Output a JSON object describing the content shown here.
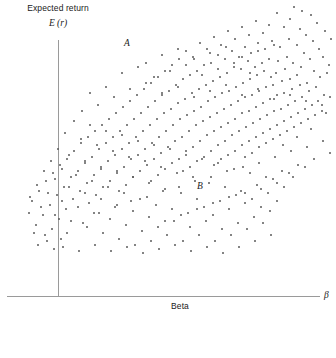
{
  "chart_data": {
    "type": "scatter",
    "title": "",
    "ylabel": "Expected return",
    "ylabel_symbol": "E (r)",
    "xlabel": "Beta",
    "xlabel_symbol": "β",
    "grid": false,
    "legend": null,
    "xlim": [
      -0.5,
      3.0
    ],
    "ylim": [
      0,
      1.0
    ],
    "annotations": [
      {
        "text": "A",
        "x_px": 124,
        "y_px": 38
      },
      {
        "text": "B",
        "x_px": 197,
        "y_px": 181
      }
    ],
    "axis_color": "#9a9a9a",
    "point_color": "#5b5b5b",
    "n_points": 420,
    "points": [
      [
        293,
        6
      ],
      [
        301,
        10
      ],
      [
        289,
        18
      ],
      [
        310,
        14
      ],
      [
        283,
        26
      ],
      [
        299,
        28
      ],
      [
        316,
        22
      ],
      [
        305,
        34
      ],
      [
        276,
        12
      ],
      [
        268,
        24
      ],
      [
        324,
        30
      ],
      [
        288,
        38
      ],
      [
        296,
        44
      ],
      [
        312,
        40
      ],
      [
        262,
        32
      ],
      [
        279,
        46
      ],
      [
        318,
        48
      ],
      [
        303,
        52
      ],
      [
        255,
        20
      ],
      [
        271,
        40
      ],
      [
        330,
        38
      ],
      [
        286,
        56
      ],
      [
        309,
        58
      ],
      [
        248,
        34
      ],
      [
        264,
        48
      ],
      [
        322,
        56
      ],
      [
        292,
        62
      ],
      [
        241,
        26
      ],
      [
        257,
        42
      ],
      [
        277,
        60
      ],
      [
        300,
        66
      ],
      [
        328,
        64
      ],
      [
        234,
        38
      ],
      [
        250,
        52
      ],
      [
        268,
        58
      ],
      [
        284,
        68
      ],
      [
        313,
        70
      ],
      [
        227,
        30
      ],
      [
        244,
        46
      ],
      [
        261,
        62
      ],
      [
        275,
        72
      ],
      [
        296,
        74
      ],
      [
        319,
        76
      ],
      [
        220,
        44
      ],
      [
        238,
        56
      ],
      [
        254,
        66
      ],
      [
        270,
        76
      ],
      [
        289,
        78
      ],
      [
        306,
        82
      ],
      [
        326,
        72
      ],
      [
        213,
        36
      ],
      [
        231,
        50
      ],
      [
        247,
        60
      ],
      [
        263,
        70
      ],
      [
        281,
        80
      ],
      [
        299,
        84
      ],
      [
        315,
        86
      ],
      [
        206,
        48
      ],
      [
        224,
        58
      ],
      [
        240,
        68
      ],
      [
        256,
        74
      ],
      [
        272,
        84
      ],
      [
        291,
        88
      ],
      [
        308,
        90
      ],
      [
        323,
        94
      ],
      [
        199,
        42
      ],
      [
        217,
        54
      ],
      [
        233,
        66
      ],
      [
        249,
        78
      ],
      [
        265,
        86
      ],
      [
        283,
        92
      ],
      [
        301,
        96
      ],
      [
        317,
        100
      ],
      [
        192,
        56
      ],
      [
        210,
        62
      ],
      [
        226,
        72
      ],
      [
        242,
        82
      ],
      [
        258,
        90
      ],
      [
        276,
        94
      ],
      [
        294,
        100
      ],
      [
        311,
        104
      ],
      [
        329,
        96
      ],
      [
        185,
        50
      ],
      [
        203,
        64
      ],
      [
        219,
        76
      ],
      [
        235,
        86
      ],
      [
        251,
        94
      ],
      [
        269,
        98
      ],
      [
        287,
        104
      ],
      [
        304,
        108
      ],
      [
        321,
        110
      ],
      [
        178,
        58
      ],
      [
        196,
        70
      ],
      [
        212,
        80
      ],
      [
        228,
        90
      ],
      [
        244,
        96
      ],
      [
        262,
        102
      ],
      [
        280,
        108
      ],
      [
        297,
        112
      ],
      [
        314,
        114
      ],
      [
        171,
        64
      ],
      [
        189,
        74
      ],
      [
        205,
        84
      ],
      [
        221,
        92
      ],
      [
        237,
        100
      ],
      [
        255,
        106
      ],
      [
        273,
        110
      ],
      [
        290,
        116
      ],
      [
        307,
        118
      ],
      [
        325,
        112
      ],
      [
        164,
        70
      ],
      [
        182,
        78
      ],
      [
        198,
        88
      ],
      [
        214,
        96
      ],
      [
        230,
        104
      ],
      [
        248,
        110
      ],
      [
        266,
        114
      ],
      [
        283,
        120
      ],
      [
        300,
        122
      ],
      [
        157,
        76
      ],
      [
        175,
        84
      ],
      [
        191,
        92
      ],
      [
        207,
        100
      ],
      [
        223,
        108
      ],
      [
        241,
        112
      ],
      [
        259,
        118
      ],
      [
        276,
        124
      ],
      [
        293,
        126
      ],
      [
        310,
        128
      ],
      [
        150,
        82
      ],
      [
        168,
        90
      ],
      [
        184,
        98
      ],
      [
        200,
        106
      ],
      [
        216,
        112
      ],
      [
        234,
        118
      ],
      [
        252,
        122
      ],
      [
        269,
        128
      ],
      [
        286,
        130
      ],
      [
        143,
        88
      ],
      [
        161,
        94
      ],
      [
        177,
        102
      ],
      [
        193,
        110
      ],
      [
        209,
        116
      ],
      [
        227,
        122
      ],
      [
        245,
        126
      ],
      [
        262,
        132
      ],
      [
        279,
        134
      ],
      [
        296,
        136
      ],
      [
        136,
        94
      ],
      [
        154,
        100
      ],
      [
        170,
        108
      ],
      [
        186,
        114
      ],
      [
        202,
        120
      ],
      [
        220,
        126
      ],
      [
        238,
        130
      ],
      [
        255,
        136
      ],
      [
        272,
        138
      ],
      [
        129,
        100
      ],
      [
        147,
        106
      ],
      [
        163,
        112
      ],
      [
        179,
        118
      ],
      [
        195,
        124
      ],
      [
        213,
        130
      ],
      [
        231,
        134
      ],
      [
        248,
        140
      ],
      [
        265,
        142
      ],
      [
        282,
        144
      ],
      [
        122,
        106
      ],
      [
        140,
        112
      ],
      [
        156,
        118
      ],
      [
        172,
        124
      ],
      [
        188,
        130
      ],
      [
        206,
        134
      ],
      [
        224,
        140
      ],
      [
        241,
        144
      ],
      [
        258,
        146
      ],
      [
        115,
        112
      ],
      [
        133,
        118
      ],
      [
        149,
        124
      ],
      [
        165,
        130
      ],
      [
        181,
        136
      ],
      [
        199,
        140
      ],
      [
        217,
        144
      ],
      [
        234,
        150
      ],
      [
        251,
        152
      ],
      [
        108,
        118
      ],
      [
        126,
        124
      ],
      [
        142,
        130
      ],
      [
        158,
        136
      ],
      [
        174,
        140
      ],
      [
        192,
        146
      ],
      [
        210,
        150
      ],
      [
        227,
        154
      ],
      [
        244,
        156
      ],
      [
        101,
        124
      ],
      [
        119,
        130
      ],
      [
        135,
        136
      ],
      [
        151,
        142
      ],
      [
        167,
        146
      ],
      [
        185,
        150
      ],
      [
        203,
        156
      ],
      [
        220,
        158
      ],
      [
        94,
        130
      ],
      [
        112,
        136
      ],
      [
        128,
        142
      ],
      [
        144,
        148
      ],
      [
        160,
        152
      ],
      [
        178,
        158
      ],
      [
        196,
        160
      ],
      [
        213,
        164
      ],
      [
        87,
        136
      ],
      [
        105,
        142
      ],
      [
        121,
        148
      ],
      [
        137,
        154
      ],
      [
        153,
        158
      ],
      [
        171,
        162
      ],
      [
        189,
        166
      ],
      [
        80,
        142
      ],
      [
        98,
        148
      ],
      [
        114,
        154
      ],
      [
        130,
        158
      ],
      [
        146,
        164
      ],
      [
        164,
        168
      ],
      [
        182,
        170
      ],
      [
        73,
        150
      ],
      [
        91,
        156
      ],
      [
        107,
        160
      ],
      [
        123,
        166
      ],
      [
        139,
        170
      ],
      [
        157,
        174
      ],
      [
        66,
        158
      ],
      [
        84,
        162
      ],
      [
        100,
        168
      ],
      [
        116,
        172
      ],
      [
        132,
        176
      ],
      [
        150,
        180
      ],
      [
        59,
        164
      ],
      [
        77,
        170
      ],
      [
        93,
        174
      ],
      [
        109,
        180
      ],
      [
        125,
        184
      ],
      [
        52,
        172
      ],
      [
        70,
        176
      ],
      [
        86,
        182
      ],
      [
        102,
        186
      ],
      [
        118,
        190
      ],
      [
        45,
        180
      ],
      [
        63,
        186
      ],
      [
        79,
        190
      ],
      [
        95,
        194
      ],
      [
        38,
        190
      ],
      [
        56,
        194
      ],
      [
        72,
        198
      ],
      [
        88,
        202
      ],
      [
        31,
        200
      ],
      [
        49,
        204
      ],
      [
        65,
        208
      ],
      [
        42,
        214
      ],
      [
        58,
        218
      ],
      [
        35,
        224
      ],
      [
        51,
        228
      ],
      [
        28,
        212
      ],
      [
        44,
        234
      ],
      [
        60,
        238
      ],
      [
        37,
        244
      ],
      [
        53,
        248
      ],
      [
        66,
        232
      ],
      [
        82,
        222
      ],
      [
        98,
        212
      ],
      [
        114,
        206
      ],
      [
        130,
        200
      ],
      [
        146,
        196
      ],
      [
        162,
        190
      ],
      [
        178,
        186
      ],
      [
        194,
        180
      ],
      [
        210,
        176
      ],
      [
        226,
        170
      ],
      [
        242,
        166
      ],
      [
        258,
        162
      ],
      [
        274,
        156
      ],
      [
        290,
        150
      ],
      [
        306,
        146
      ],
      [
        322,
        140
      ],
      [
        145,
        62
      ],
      [
        161,
        54
      ],
      [
        177,
        48
      ],
      [
        193,
        58
      ],
      [
        209,
        52
      ],
      [
        225,
        46
      ],
      [
        241,
        56
      ],
      [
        257,
        50
      ],
      [
        273,
        44
      ],
      [
        121,
        72
      ],
      [
        137,
        66
      ],
      [
        153,
        76
      ],
      [
        169,
        70
      ],
      [
        185,
        64
      ],
      [
        201,
        74
      ],
      [
        217,
        68
      ],
      [
        233,
        62
      ],
      [
        249,
        72
      ],
      [
        105,
        86
      ],
      [
        89,
        92
      ],
      [
        113,
        96
      ],
      [
        97,
        104
      ],
      [
        81,
        110
      ],
      [
        129,
        88
      ],
      [
        145,
        82
      ],
      [
        161,
        92
      ],
      [
        177,
        86
      ],
      [
        193,
        96
      ],
      [
        209,
        90
      ],
      [
        225,
        84
      ],
      [
        241,
        94
      ],
      [
        257,
        88
      ],
      [
        273,
        98
      ],
      [
        289,
        94
      ],
      [
        305,
        100
      ],
      [
        321,
        104
      ],
      [
        73,
        120
      ],
      [
        89,
        124
      ],
      [
        105,
        130
      ],
      [
        121,
        134
      ],
      [
        137,
        140
      ],
      [
        153,
        144
      ],
      [
        169,
        148
      ],
      [
        185,
        154
      ],
      [
        201,
        158
      ],
      [
        217,
        162
      ],
      [
        233,
        168
      ],
      [
        249,
        172
      ],
      [
        265,
        176
      ],
      [
        281,
        170
      ],
      [
        297,
        164
      ],
      [
        313,
        158
      ],
      [
        329,
        152
      ],
      [
        64,
        132
      ],
      [
        80,
        138
      ],
      [
        96,
        144
      ],
      [
        112,
        150
      ],
      [
        128,
        156
      ],
      [
        144,
        160
      ],
      [
        160,
        166
      ],
      [
        176,
        172
      ],
      [
        192,
        176
      ],
      [
        208,
        182
      ],
      [
        224,
        186
      ],
      [
        240,
        190
      ],
      [
        256,
        184
      ],
      [
        272,
        178
      ],
      [
        288,
        172
      ],
      [
        304,
        166
      ],
      [
        57,
        148
      ],
      [
        68,
        154
      ],
      [
        84,
        160
      ],
      [
        100,
        166
      ],
      [
        116,
        170
      ],
      [
        132,
        176
      ],
      [
        148,
        182
      ],
      [
        164,
        188
      ],
      [
        180,
        192
      ],
      [
        196,
        198
      ],
      [
        212,
        202
      ],
      [
        228,
        196
      ],
      [
        244,
        192
      ],
      [
        260,
        188
      ],
      [
        276,
        182
      ],
      [
        292,
        176
      ],
      [
        50,
        160
      ],
      [
        61,
        168
      ],
      [
        75,
        174
      ],
      [
        91,
        180
      ],
      [
        107,
        186
      ],
      [
        123,
        192
      ],
      [
        139,
        198
      ],
      [
        155,
        204
      ],
      [
        171,
        208
      ],
      [
        187,
        212
      ],
      [
        203,
        206
      ],
      [
        219,
        200
      ],
      [
        235,
        194
      ],
      [
        251,
        198
      ],
      [
        267,
        192
      ],
      [
        283,
        186
      ],
      [
        43,
        170
      ],
      [
        54,
        178
      ],
      [
        68,
        186
      ],
      [
        84,
        192
      ],
      [
        100,
        198
      ],
      [
        116,
        204
      ],
      [
        132,
        210
      ],
      [
        148,
        216
      ],
      [
        164,
        220
      ],
      [
        180,
        214
      ],
      [
        196,
        208
      ],
      [
        212,
        214
      ],
      [
        228,
        208
      ],
      [
        244,
        202
      ],
      [
        260,
        206
      ],
      [
        276,
        200
      ],
      [
        36,
        184
      ],
      [
        47,
        192
      ],
      [
        61,
        200
      ],
      [
        77,
        206
      ],
      [
        93,
        212
      ],
      [
        109,
        218
      ],
      [
        125,
        224
      ],
      [
        141,
        230
      ],
      [
        157,
        226
      ],
      [
        173,
        220
      ],
      [
        189,
        226
      ],
      [
        205,
        220
      ],
      [
        221,
        228
      ],
      [
        237,
        222
      ],
      [
        253,
        216
      ],
      [
        269,
        210
      ],
      [
        29,
        196
      ],
      [
        40,
        206
      ],
      [
        54,
        214
      ],
      [
        70,
        220
      ],
      [
        86,
        226
      ],
      [
        102,
        232
      ],
      [
        118,
        238
      ],
      [
        134,
        244
      ],
      [
        150,
        240
      ],
      [
        166,
        234
      ],
      [
        182,
        240
      ],
      [
        198,
        234
      ],
      [
        214,
        240
      ],
      [
        230,
        234
      ],
      [
        246,
        228
      ],
      [
        262,
        222
      ],
      [
        33,
        232
      ],
      [
        46,
        240
      ],
      [
        62,
        246
      ],
      [
        78,
        250
      ],
      [
        94,
        244
      ],
      [
        110,
        250
      ],
      [
        126,
        246
      ],
      [
        142,
        252
      ],
      [
        158,
        248
      ],
      [
        174,
        244
      ],
      [
        190,
        250
      ],
      [
        206,
        246
      ],
      [
        222,
        252
      ],
      [
        238,
        246
      ],
      [
        254,
        240
      ],
      [
        270,
        234
      ]
    ]
  }
}
